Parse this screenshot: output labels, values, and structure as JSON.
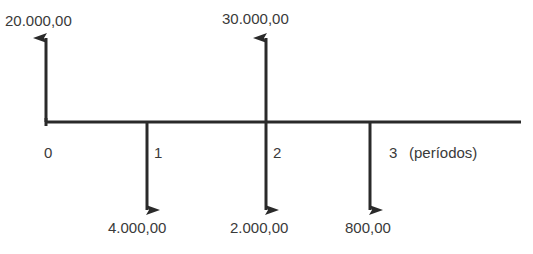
{
  "diagram": {
    "type": "cash-flow-diagram",
    "axis_label": "(períodos)",
    "periods": [
      {
        "label": "0"
      },
      {
        "label": "1"
      },
      {
        "label": "2"
      },
      {
        "label": "3"
      }
    ],
    "inflows": [
      {
        "period": "0",
        "amount": "20.000,00"
      },
      {
        "period": "2",
        "amount": "30.000,00"
      }
    ],
    "outflows": [
      {
        "period": "1",
        "amount": "4.000,00"
      },
      {
        "period": "2",
        "amount": "2.000,00"
      },
      {
        "period": "3",
        "amount": "800,00"
      }
    ],
    "colors": {
      "line": "#2a2a2a",
      "text": "#3a3a3a",
      "background": "#ffffff"
    }
  }
}
